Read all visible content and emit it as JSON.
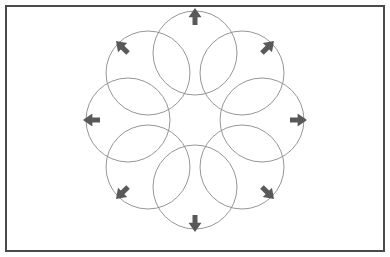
{
  "figure": {
    "background_color": "#ffffff",
    "width": 390,
    "height": 257
  },
  "frame": {
    "name": "outer-border",
    "x": 6,
    "y": 6,
    "width": 378,
    "height": 245,
    "stroke_color": "#4a4a4a",
    "stroke_width": 2,
    "fill": "none"
  },
  "chart_data": {
    "type": "diagram",
    "subtype": "overlapping-circle rosette with radial outward arrows",
    "center": {
      "x": 195,
      "y": 120
    },
    "ring_radius": 67,
    "circle_radius": 42,
    "circle_count": 8,
    "angle_step_deg": 45,
    "angle_offset_deg": -90,
    "circle_stroke_color": "#8a8a8a",
    "circle_stroke_width": 0.9,
    "circle_fill": "none",
    "arrow_color": "#595959",
    "arrow_length": 17,
    "arrow_head_width": 13,
    "arrow_shaft_width": 5,
    "arrow_gap": 2,
    "elements": [
      {
        "index": 0,
        "label": "N",
        "angle_deg": -90,
        "cx": 195,
        "cy": 53,
        "arrow_direction": "up",
        "arrow_tip_x": 195,
        "arrow_tip_y": 8
      },
      {
        "index": 1,
        "label": "NE",
        "angle_deg": -45,
        "cx": 242,
        "cy": 73,
        "arrow_direction": "up-right",
        "arrow_tip_x": 274,
        "arrow_tip_y": 41
      },
      {
        "index": 2,
        "label": "E",
        "angle_deg": 0,
        "cx": 262,
        "cy": 120,
        "arrow_direction": "right",
        "arrow_tip_x": 307,
        "arrow_tip_y": 120
      },
      {
        "index": 3,
        "label": "SE",
        "angle_deg": 45,
        "cx": 242,
        "cy": 167,
        "arrow_direction": "down-right",
        "arrow_tip_x": 274,
        "arrow_tip_y": 199
      },
      {
        "index": 4,
        "label": "S-E",
        "angle_deg": 90,
        "cx": 195,
        "cy": 187,
        "arrow_direction": "down",
        "arrow_tip_x": 195,
        "arrow_tip_y": 232
      },
      {
        "index": 5,
        "label": "SW",
        "angle_deg": 135,
        "cx": 148,
        "cy": 167,
        "arrow_direction": "down-left",
        "arrow_tip_x": 116,
        "arrow_tip_y": 199
      },
      {
        "index": 6,
        "label": "W",
        "angle_deg": 180,
        "cx": 128,
        "cy": 120,
        "arrow_direction": "left",
        "arrow_tip_x": 83,
        "arrow_tip_y": 120
      },
      {
        "index": 7,
        "label": "NW",
        "angle_deg": -135,
        "cx": 148,
        "cy": 73,
        "arrow_direction": "up-left",
        "arrow_tip_x": 116,
        "arrow_tip_y": 41
      }
    ],
    "layout": {
      "grid": false,
      "legend": false,
      "axes": false,
      "labels_visible": false
    }
  }
}
